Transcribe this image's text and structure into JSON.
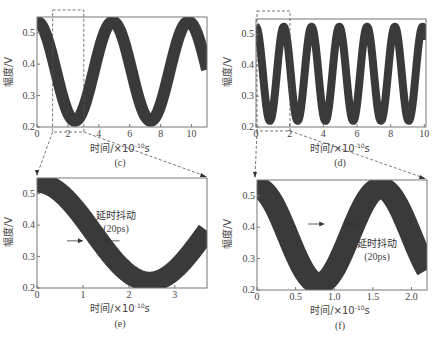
{
  "chart_data": [
    {
      "id": "c",
      "type": "line",
      "caption": "(c)",
      "xlabel": "时间/×10⁻¹⁰s",
      "ylabel": "幅度/V",
      "xlim": [
        0,
        11
      ],
      "ylim": [
        0.2,
        0.55
      ],
      "xticks": [
        0,
        2,
        4,
        6,
        8,
        10
      ],
      "yticks": [
        0.2,
        0.3,
        0.4,
        0.5
      ],
      "series": [
        {
          "name": "signal",
          "freq_GHz": 2.0,
          "min": 0.22,
          "max": 0.535,
          "phase_peak_x": 0,
          "period_x": 4.9
        }
      ],
      "zoom_box": {
        "x": [
          1,
          3
        ],
        "target": "e"
      }
    },
    {
      "id": "d",
      "type": "line",
      "caption": "(d)",
      "xlabel": "时间/×10⁻¹⁰s",
      "ylabel": "幅度/V",
      "xlim": [
        0,
        10.1
      ],
      "ylim": [
        0.2,
        0.55
      ],
      "xticks": [
        0,
        2,
        4,
        6,
        8,
        10
      ],
      "yticks": [
        0.2,
        0.3,
        0.4,
        0.5
      ],
      "series": [
        {
          "name": "signal",
          "freq_GHz": 6.0,
          "min": 0.22,
          "max": 0.525,
          "phase_peak_x": 0,
          "period_x": 1.65
        }
      ],
      "zoom_box": {
        "x": [
          0,
          2
        ],
        "target": "f"
      }
    },
    {
      "id": "e",
      "type": "line",
      "caption": "(e)",
      "xlabel": "时间/×10⁻¹⁰s",
      "ylabel": "幅度/V",
      "xlim": [
        0,
        3.7
      ],
      "ylim": [
        0.2,
        0.55
      ],
      "xticks": [
        0,
        1,
        2,
        3
      ],
      "yticks": [
        0.2,
        0.3,
        0.4,
        0.5
      ],
      "series": [
        {
          "name": "signal",
          "min": 0.22,
          "max": 0.535,
          "phase_peak_x": 0,
          "period_x": 4.9
        }
      ],
      "annotation": {
        "text": "延时抖动",
        "subtext": "(20ps)",
        "arrow_y": 0.35,
        "arrow_x": [
          1.0,
          1.45
        ]
      }
    },
    {
      "id": "f",
      "type": "line",
      "caption": "(f)",
      "xlabel": "时间/×10⁻¹⁰s",
      "ylabel": "幅度/V",
      "xlim": [
        0,
        2.2
      ],
      "ylim": [
        0.2,
        0.55
      ],
      "xticks": [
        0,
        0.5,
        1.0,
        1.5,
        2.0
      ],
      "yticks": [
        0.2,
        0.3,
        0.4,
        0.5
      ],
      "series": [
        {
          "name": "signal",
          "min": 0.22,
          "max": 0.525,
          "phase_peak_x": 0,
          "period_x": 1.6
        }
      ],
      "annotation": {
        "text": "延时抖动",
        "subtext": "(20ps)",
        "arrow_y": 0.41,
        "arrow_x": [
          0.87,
          1.13
        ]
      }
    }
  ],
  "panels": {
    "c": {
      "caption": "(c)",
      "xlabel": "时间/×10",
      "xexp": "-10",
      "xunit": "s",
      "ylabel": "幅度/V"
    },
    "d": {
      "caption": "(d)",
      "xlabel": "时间/×10",
      "xexp": "-10",
      "xunit": "s",
      "ylabel": "幅度/V"
    },
    "e": {
      "caption": "(e)",
      "xlabel": "时间/×10",
      "xexp": "-10",
      "xunit": "s",
      "ylabel": "幅度/V",
      "ann1": "延时抖动",
      "ann2": "(20ps)"
    },
    "f": {
      "caption": "(f)",
      "xlabel": "时间/×10",
      "xexp": "-10",
      "xunit": "s",
      "ylabel": "幅度/V",
      "ann1": "延时抖动",
      "ann2": "(20ps)"
    }
  },
  "style": {
    "trace_color": "#3a3a3a",
    "axis_color": "#777777",
    "dash_color": "#555555"
  }
}
